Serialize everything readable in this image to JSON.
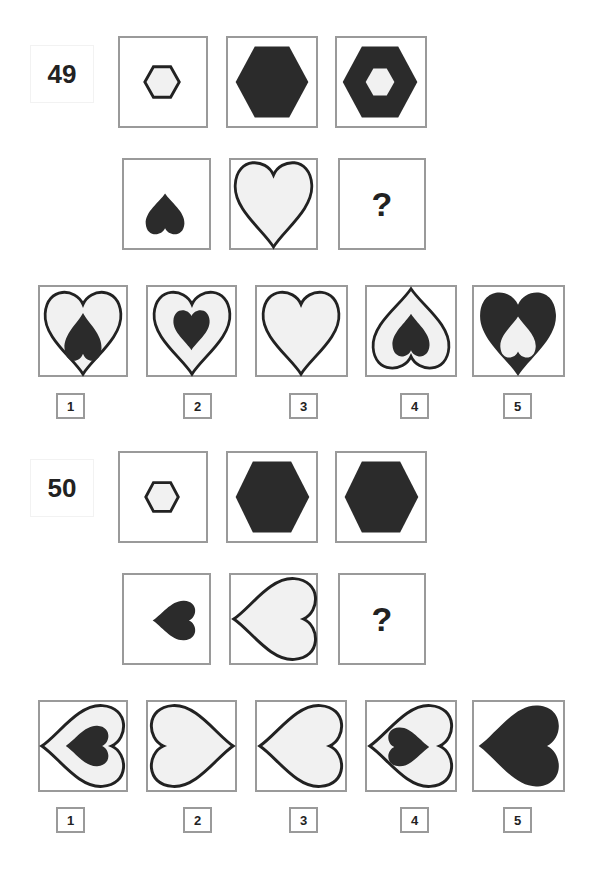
{
  "puzzles": [
    {
      "number": "49",
      "row1": [
        {
          "shape": "small-outline-hexagon"
        },
        {
          "shape": "large-solid-hexagon"
        },
        {
          "shape": "large-solid-hexagon-with-small-light-hexagon"
        }
      ],
      "row2": [
        {
          "shape": "small-solid-heart-inverted"
        },
        {
          "shape": "large-outline-heart"
        },
        {
          "shape": "question",
          "text": "?"
        }
      ],
      "options": [
        {
          "label": "1",
          "shape": "large-outline-heart-with-small-solid-inverted-heart"
        },
        {
          "label": "2",
          "shape": "large-outline-heart-with-small-solid-heart"
        },
        {
          "label": "3",
          "shape": "large-outline-heart"
        },
        {
          "label": "4",
          "shape": "large-outline-inverted-heart-with-small-solid-inverted-heart"
        },
        {
          "label": "5",
          "shape": "large-solid-heart-with-small-light-inverted-heart"
        }
      ]
    },
    {
      "number": "50",
      "row1": [
        {
          "shape": "small-outline-hexagon"
        },
        {
          "shape": "large-solid-hexagon"
        },
        {
          "shape": "large-solid-hexagon"
        }
      ],
      "row2": [
        {
          "shape": "small-solid-heart-pointing-left"
        },
        {
          "shape": "large-outline-heart-pointing-left"
        },
        {
          "shape": "question",
          "text": "?"
        }
      ],
      "options": [
        {
          "label": "1",
          "shape": "large-outline-left-heart-with-small-solid-left-heart"
        },
        {
          "label": "2",
          "shape": "large-outline-right-heart"
        },
        {
          "label": "3",
          "shape": "large-outline-left-heart"
        },
        {
          "label": "4",
          "shape": "large-outline-left-heart-with-small-solid-right-heart"
        },
        {
          "label": "5",
          "shape": "large-solid-left-heart"
        }
      ]
    }
  ],
  "colors": {
    "frame": "#9a9a9a",
    "solid": "#2b2b2b",
    "light_fill": "#f1f1f1",
    "stroke": "#222222"
  }
}
